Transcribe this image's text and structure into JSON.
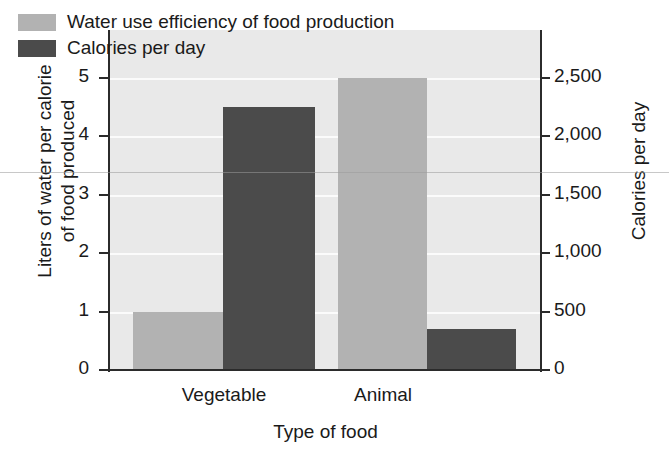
{
  "chart_data": {
    "type": "bar",
    "title": "",
    "xlabel": "Type of food",
    "ylabel": "Liters of water per calorie of food produced",
    "ylabel_line1": "Liters of water per calorie",
    "ylabel_line2": "of food produced",
    "y2label": "Calories per day",
    "categories": [
      "Vegetable",
      "Animal"
    ],
    "ylim": [
      0,
      5
    ],
    "y2lim": [
      0,
      2500
    ],
    "yticks": [
      "0",
      "1",
      "2",
      "3",
      "4",
      "5"
    ],
    "ytick_values": [
      0,
      1,
      2,
      3,
      4,
      5
    ],
    "y2ticks": [
      "0",
      "500",
      "1,000",
      "1,500",
      "2,000",
      "2,500"
    ],
    "y2tick_values": [
      0,
      500,
      1000,
      1500,
      2000,
      2500
    ],
    "grid": true,
    "legend_position": "top-left",
    "series": [
      {
        "name": "Water use efficiency of food production",
        "axis": "left",
        "unit": "Liters of water per calorie of food produced",
        "color": "#b2b2b2",
        "values": [
          1.0,
          5.0
        ]
      },
      {
        "name": "Calories per day",
        "axis": "right",
        "unit": "Calories per day",
        "color": "#4b4b4b",
        "values": [
          2250,
          350
        ]
      }
    ]
  },
  "legend": {
    "items": [
      {
        "label": "Water use efficiency of food production",
        "color": "#b2b2b2"
      },
      {
        "label": "Calories per day",
        "color": "#4b4b4b"
      }
    ]
  },
  "colors": {
    "series_light": "#b2b2b2",
    "series_dark": "#4b4b4b",
    "plot_background": "#e9e9e9",
    "gridline": "#fbfbfb",
    "axis": "#2b2b2b",
    "text": "#1a1a1a"
  }
}
